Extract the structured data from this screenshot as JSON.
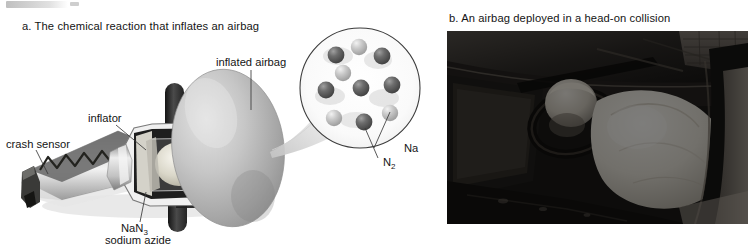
{
  "figure": {
    "panels": [
      {
        "id": "a",
        "caption": "a. The chemical reaction that inflates an airbag",
        "type": "labeled-diagram"
      },
      {
        "id": "b",
        "caption": "b. An airbag deployed in a head-on collision",
        "type": "photograph"
      }
    ]
  },
  "diagram": {
    "labels": {
      "crash_sensor": "crash sensor",
      "inflator": "inflator",
      "inflated_airbag": "inflated airbag",
      "nan3_formula": "NaN",
      "nan3_subscript": "3",
      "sodium_azide": "sodium azide",
      "na": "Na",
      "n2_formula": "N",
      "n2_subscript": "2"
    },
    "magnifier": {
      "description": "Magnified circular inset showing gas molecules produced by the reaction",
      "species": [
        {
          "name": "N2",
          "label": "N₂",
          "appearance": "dark sphere",
          "color": "#5d5d5d",
          "count": 6
        },
        {
          "name": "Na",
          "label": "Na",
          "appearance": "light sphere",
          "color": "#b8b8b8",
          "count": 5
        }
      ]
    },
    "colors": {
      "airbag_fill": "#b9b9b9",
      "housing_dark": "#2b2b2b",
      "propellant": "#dedcd2",
      "shaft_metal": "#c9c9c9",
      "leader_line": "#3a3a3a",
      "text": "#141414",
      "background": "#ffffff"
    }
  },
  "photo": {
    "alt": "Black and white photograph of a car interior with a deployed white airbag covering the steering wheel and a person's head beside it",
    "palette": {
      "dark": "#1b1b19",
      "mid": "#5a5752",
      "airbag_white": "#efece4",
      "brick": "#6d6660"
    }
  }
}
